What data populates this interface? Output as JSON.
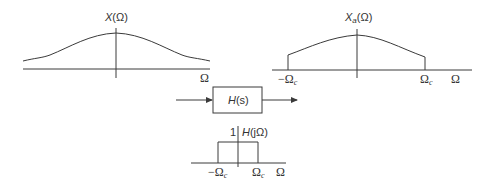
{
  "diagram": {
    "input_spectrum": {
      "label": "X(Ω)",
      "label_main": "X",
      "label_arg": "(Ω)",
      "axis_label": "Ω"
    },
    "filter_block": {
      "label": "H(s)",
      "label_main": "H",
      "label_arg": "(s)"
    },
    "filter_response": {
      "label": "H(jΩ)",
      "label_main": "H",
      "label_arg": "(jΩ)",
      "amplitude_tick": "1",
      "neg_cutoff": "−Ω",
      "pos_cutoff": "Ω",
      "cutoff_subscript": "c",
      "axis_label": "Ω"
    },
    "output_spectrum": {
      "label": "Xa(Ω)",
      "label_main": "X",
      "label_subscript": "a",
      "label_arg": "(Ω)",
      "neg_cutoff": "−Ω",
      "pos_cutoff": "Ω",
      "cutoff_subscript": "c",
      "axis_label": "Ω"
    },
    "colors": {
      "line": "#3a3a3a",
      "text": "#333333",
      "background": "#ffffff"
    }
  }
}
